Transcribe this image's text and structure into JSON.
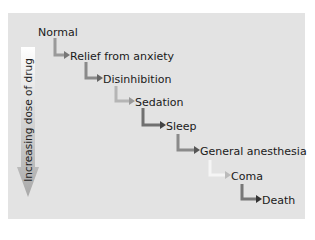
{
  "diagram": {
    "axis_label": "Increasing dose of drug",
    "stages": [
      {
        "label": "Normal",
        "x": 38,
        "y": 27
      },
      {
        "label": "Relief from anxiety",
        "x": 70,
        "y": 51
      },
      {
        "label": "Disinhibition",
        "x": 103,
        "y": 74
      },
      {
        "label": "Sedation",
        "x": 135,
        "y": 97
      },
      {
        "label": "Sleep",
        "x": 166,
        "y": 121
      },
      {
        "label": "General anesthesia",
        "x": 200,
        "y": 146
      },
      {
        "label": "Coma",
        "x": 231,
        "y": 171
      },
      {
        "label": "Death",
        "x": 262,
        "y": 195
      }
    ],
    "colors": {
      "panel": "#e3e3e3",
      "arrow_light": "#f2f2f2",
      "arrow_dark": "#555555"
    }
  }
}
